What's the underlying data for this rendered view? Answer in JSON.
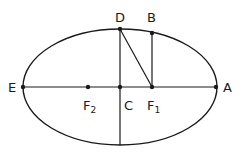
{
  "diagram": {
    "type": "ellipse-geometry",
    "colors": {
      "stroke": "#1a1a1a",
      "background": "#ffffff"
    },
    "points": {
      "E": {
        "label": "E",
        "x": 23,
        "y": 87
      },
      "A": {
        "label": "A",
        "x": 216,
        "y": 87
      },
      "C": {
        "label": "C",
        "x": 120,
        "y": 87
      },
      "D": {
        "label": "D",
        "x": 120,
        "y": 29
      },
      "B": {
        "label": "B",
        "x": 152,
        "y": 33
      },
      "F1": {
        "label": "F",
        "sub": "1",
        "x": 152,
        "y": 87
      },
      "F2": {
        "label": "F",
        "sub": "2",
        "x": 88,
        "y": 87
      }
    },
    "segments": [
      "E-A",
      "D-bottom",
      "D-F1",
      "B-F1"
    ]
  }
}
